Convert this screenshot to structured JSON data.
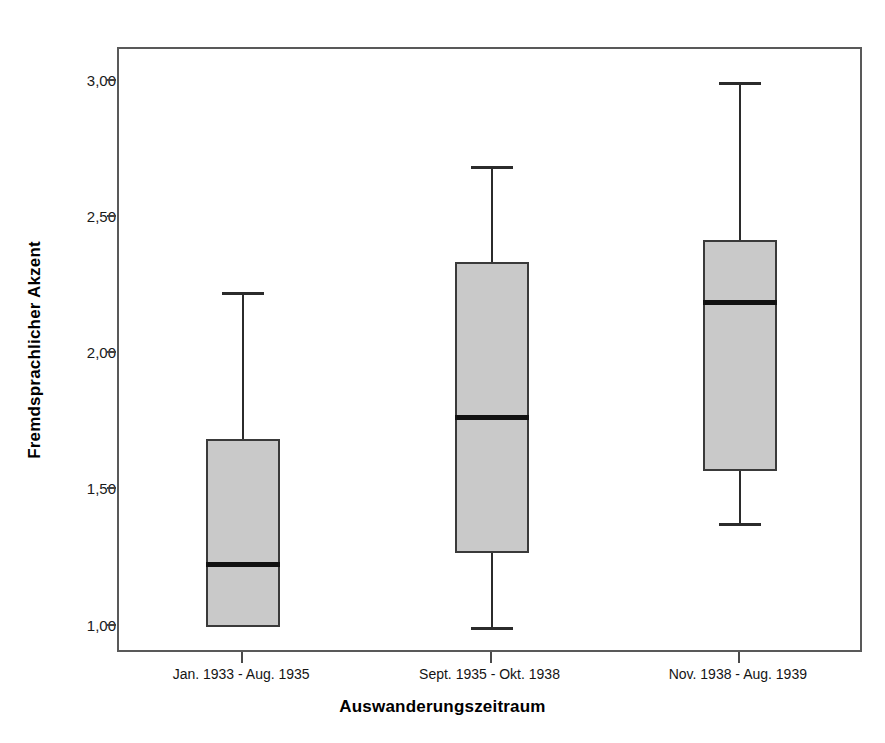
{
  "figure": {
    "top_artifact_text": "",
    "bottom_artifact_text": ""
  },
  "axes": {
    "y_title": "Fremdsprachlicher Akzent",
    "x_title": "Auswanderungszeitraum",
    "y_ticks": [
      "1,00",
      "1,50",
      "2,00",
      "2,50",
      "3,00"
    ],
    "y_tick_values": [
      1.0,
      1.5,
      2.0,
      2.5,
      3.0
    ]
  },
  "chart_data": {
    "type": "box",
    "title": "",
    "xlabel": "Auswanderungszeitraum",
    "ylabel": "Fremdsprachlicher Akzent",
    "ylim": [
      0.9,
      3.12
    ],
    "ytick_labels": [
      "1,00",
      "1,50",
      "2,00",
      "2,50",
      "3,00"
    ],
    "ytick_values": [
      1.0,
      1.5,
      2.0,
      2.5,
      3.0
    ],
    "grid": false,
    "legend": "none",
    "categories": [
      "Jan. 1933 - Aug. 1935",
      "Sept. 1935 - Okt. 1938",
      "Nov. 1938 - Aug. 1939"
    ],
    "boxes": [
      {
        "category": "Jan. 1933 - Aug. 1935",
        "min": 1.0,
        "q1": 1.0,
        "median": 1.23,
        "q3": 1.69,
        "max": 2.23
      },
      {
        "category": "Sept. 1935 - Okt. 1938",
        "min": 1.0,
        "q1": 1.27,
        "median": 1.77,
        "q3": 2.34,
        "max": 2.69
      },
      {
        "category": "Nov. 1938 - Aug. 1939",
        "min": 1.38,
        "q1": 1.57,
        "median": 2.19,
        "q3": 2.42,
        "max": 3.0
      }
    ],
    "box_fill_color": "#c9c9c9",
    "box_edge_color": "#3a3a3a",
    "median_color": "#111111"
  }
}
